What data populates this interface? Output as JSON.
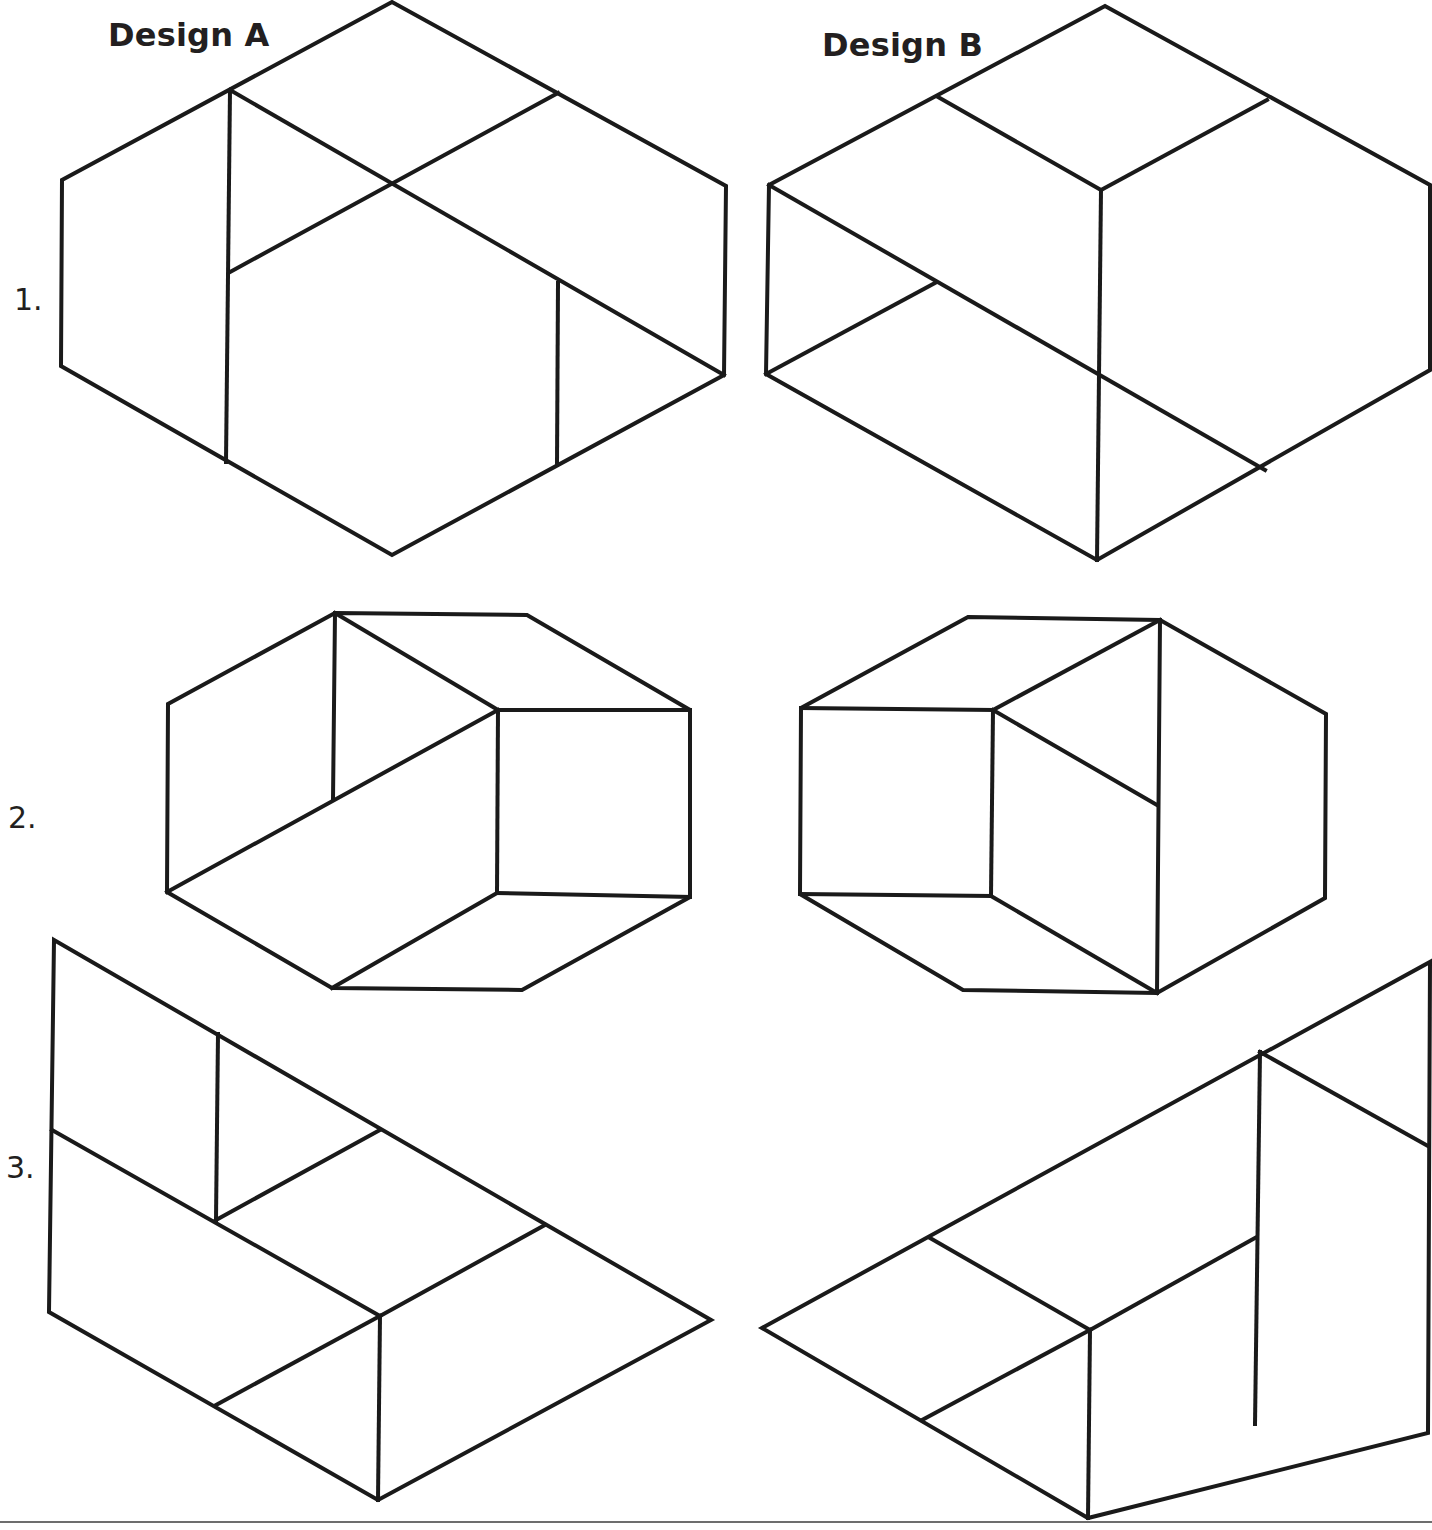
{
  "worksheet": {
    "columns": [
      {
        "title": "Design A"
      },
      {
        "title": "Design B"
      }
    ],
    "rows": [
      {
        "number": "1."
      },
      {
        "number": "2."
      },
      {
        "number": "3."
      }
    ]
  },
  "colors": {
    "line": "#1a1a1a",
    "text": "#231f20",
    "background": "#ffffff"
  }
}
